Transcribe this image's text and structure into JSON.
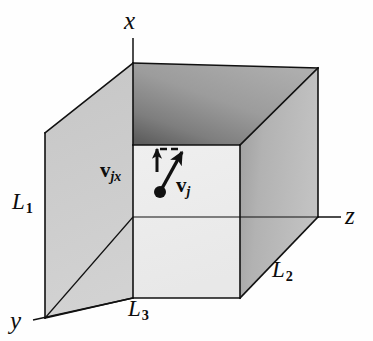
{
  "figure": {
    "background_color": "#fefefe",
    "stroke_color": "#111111"
  },
  "axes": [
    {
      "id": "x",
      "label": "x",
      "direction": "up",
      "name": "x-axis"
    },
    {
      "id": "y",
      "label": "y",
      "direction": "down-left",
      "name": "y-axis"
    },
    {
      "id": "z",
      "label": "z",
      "direction": "right",
      "name": "z-axis"
    }
  ],
  "dimensions": [
    {
      "id": "L1",
      "symbol": "L",
      "subscript": "1",
      "edge": "left-vertical",
      "name": "box-height-label"
    },
    {
      "id": "L2",
      "symbol": "L",
      "subscript": "2",
      "edge": "bottom-right-depth",
      "name": "box-depth-label"
    },
    {
      "id": "L3",
      "symbol": "L",
      "subscript": "3",
      "edge": "bottom-front",
      "name": "box-width-label"
    }
  ],
  "vectors": [
    {
      "id": "vj",
      "symbol": "v",
      "subscript": "j",
      "style": "bold",
      "description": "velocity of molecule j"
    },
    {
      "id": "vjx",
      "symbol": "v",
      "subscript": "jx",
      "style": "bold",
      "description": "x component of velocity of molecule j"
    }
  ],
  "box": {
    "faces": [
      {
        "name": "top-face",
        "shade": "dark-gradient",
        "color": "#9a9a9a"
      },
      {
        "name": "left-face",
        "shade": "medium",
        "color": "#cfcfcf"
      },
      {
        "name": "front-face",
        "shade": "light",
        "color": "#f2f2f2"
      },
      {
        "name": "right-face",
        "shade": "medium-gradient",
        "color": "#b9b9b9"
      }
    ]
  },
  "colors": {
    "ink": "#111111",
    "top_face": "#8e8e8e",
    "left_face": "#cbcbcb",
    "front_face": "#f1f1f1",
    "right_face": "#b5b5b5",
    "background": "#fefefe"
  }
}
